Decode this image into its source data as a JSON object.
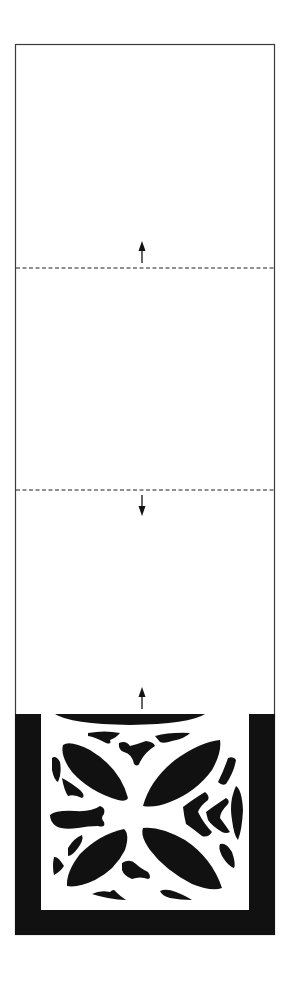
{
  "diagram": {
    "type": "folding-stencil-illustration",
    "width": 298,
    "height": 984,
    "colors": {
      "background": "#ffffff",
      "outline": "#3a3a3a",
      "fill": "#111111",
      "dash": "#222222"
    },
    "sheet": {
      "x": 15,
      "y": 44,
      "width": 260,
      "height": 891
    },
    "fold_lines": [
      {
        "y": 268,
        "style": "dashed"
      },
      {
        "y": 490,
        "style": "dashed"
      }
    ],
    "arrows": [
      {
        "x": 142,
        "y_from": 262,
        "y_to": 242,
        "direction": "up"
      },
      {
        "x": 142,
        "y_from": 495,
        "y_to": 515,
        "direction": "down"
      },
      {
        "x": 142,
        "y_from": 708,
        "y_to": 688,
        "direction": "up"
      }
    ],
    "frame": {
      "outer": {
        "x": 15,
        "y": 714,
        "width": 260,
        "height": 221
      },
      "inner": {
        "x": 41,
        "y": 714,
        "width": 208,
        "height": 196
      }
    },
    "pattern": {
      "description": "Four-petal cut-out ornament with chevron and fragment motifs",
      "petals": 4
    }
  }
}
